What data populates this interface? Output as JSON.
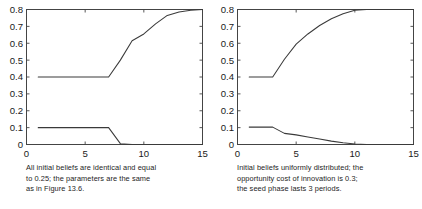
{
  "figure": {
    "panels": [
      {
        "id": "panel-left",
        "caption_lines": [
          "All initial beliefs are identical and equal",
          "to 0.25; the parameters are the same",
          "as in Figure 13.6."
        ]
      },
      {
        "id": "panel-right",
        "caption_lines": [
          "Initial beliefs uniformly distributed; the",
          "opportunity cost of innovation is 0.3;",
          "the seed phase lasts 3 periods."
        ]
      }
    ]
  },
  "chart_data": [
    {
      "type": "line",
      "title": "",
      "xlabel": "",
      "ylabel": "",
      "xlim": [
        0,
        15
      ],
      "ylim": [
        0,
        0.8
      ],
      "xticks": [
        0,
        5,
        10,
        15
      ],
      "xticklabels": [
        "0",
        "5",
        "10",
        "15"
      ],
      "yticks": [
        0,
        0.1,
        0.2,
        0.3,
        0.4,
        0.5,
        0.6,
        0.7,
        0.8
      ],
      "yticklabels": [
        "0",
        "0.1",
        "0.2",
        "0.3",
        "0.4",
        "0.5",
        "0.6",
        "0.7",
        "0.8"
      ],
      "grid": false,
      "legend": "none",
      "line_color": "#3a3a3a",
      "x": [
        1,
        2,
        3,
        4,
        5,
        6,
        7,
        8,
        9,
        10,
        11,
        12,
        13,
        14,
        15
      ],
      "series": [
        {
          "name": "upper",
          "values": [
            0.4,
            0.4,
            0.4,
            0.4,
            0.4,
            0.4,
            0.4,
            0.5,
            0.615,
            0.655,
            0.715,
            0.765,
            0.785,
            0.795,
            0.8
          ]
        },
        {
          "name": "lower",
          "values": [
            0.1,
            0.1,
            0.1,
            0.1,
            0.1,
            0.1,
            0.1,
            0.005,
            0.0,
            0.0,
            0.0,
            0.0,
            0.0,
            0.0,
            0.0
          ]
        }
      ]
    },
    {
      "type": "line",
      "title": "",
      "xlabel": "",
      "ylabel": "",
      "xlim": [
        0,
        15
      ],
      "ylim": [
        0,
        0.8
      ],
      "xticks": [
        0,
        5,
        10,
        15
      ],
      "xticklabels": [
        "0",
        "5",
        "10",
        "15"
      ],
      "yticks": [
        0,
        0.1,
        0.2,
        0.3,
        0.4,
        0.5,
        0.6,
        0.7,
        0.8
      ],
      "yticklabels": [
        "0",
        "0.1",
        "0.2",
        "0.3",
        "0.4",
        "0.5",
        "0.6",
        "0.7",
        "0.8"
      ],
      "grid": false,
      "legend": "none",
      "line_color": "#3a3a3a",
      "x": [
        1,
        2,
        3,
        4,
        5,
        6,
        7,
        8,
        9,
        10,
        11,
        12,
        13,
        14,
        15
      ],
      "series": [
        {
          "name": "upper",
          "values": [
            0.4,
            0.4,
            0.4,
            0.505,
            0.595,
            0.655,
            0.705,
            0.745,
            0.775,
            0.795,
            0.8,
            0.8,
            0.8,
            0.8,
            0.8
          ]
        },
        {
          "name": "lower",
          "values": [
            0.103,
            0.103,
            0.103,
            0.066,
            0.057,
            0.045,
            0.032,
            0.02,
            0.01,
            0.003,
            0.0,
            0.0,
            0.0,
            0.0,
            0.0
          ]
        }
      ]
    }
  ]
}
